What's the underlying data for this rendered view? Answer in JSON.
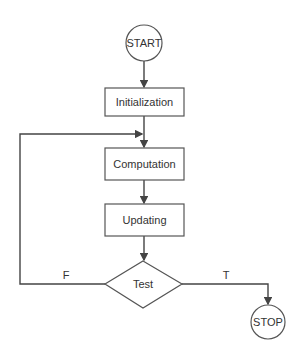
{
  "diagram": {
    "type": "flowchart",
    "nodes": {
      "start": {
        "label": "START",
        "shape": "circle"
      },
      "initialization": {
        "label": "Initialization",
        "shape": "rectangle"
      },
      "computation": {
        "label": "Computation",
        "shape": "rectangle"
      },
      "updating": {
        "label": "Updating",
        "shape": "rectangle"
      },
      "test": {
        "label": "Test",
        "shape": "diamond"
      },
      "stop": {
        "label": "STOP",
        "shape": "circle"
      }
    },
    "edges": {
      "false_label": "F",
      "true_label": "T"
    },
    "colors": {
      "stroke": "#444444",
      "background": "#ffffff"
    }
  }
}
